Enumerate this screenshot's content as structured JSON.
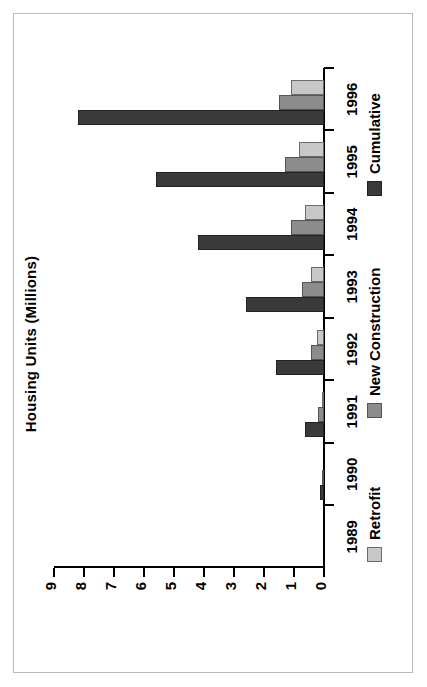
{
  "chart_data": {
    "type": "bar",
    "title": "Housing Units (Millions)",
    "xlabel": "",
    "ylabel": "Housing Units (Millions)",
    "categories": [
      "1989",
      "1990",
      "1991",
      "1992",
      "1993",
      "1994",
      "1995",
      "1996"
    ],
    "ylim": [
      0,
      9
    ],
    "yticks": [
      0,
      1,
      2,
      3,
      4,
      5,
      6,
      7,
      8,
      9
    ],
    "ytick_labels": [
      "0",
      "1",
      "2",
      "3",
      "4",
      "5",
      "6",
      "7",
      "8",
      "9"
    ],
    "grid": false,
    "orientation": "horizontal-rotated",
    "legend_position": "bottom",
    "series": [
      {
        "name": "Retrofit",
        "color": "#c8c8c8",
        "values": [
          0,
          0,
          0.08,
          0.22,
          0.42,
          0.62,
          0.85,
          1.1
        ]
      },
      {
        "name": "New Construction",
        "color": "#8c8c8c",
        "values": [
          0,
          0.04,
          0.2,
          0.42,
          0.75,
          1.1,
          1.3,
          1.5
        ]
      },
      {
        "name": "Cumulative",
        "color": "#3a3a3a",
        "values": [
          0,
          0.12,
          0.65,
          1.6,
          2.6,
          4.2,
          5.6,
          8.2
        ]
      }
    ]
  },
  "frame": {
    "border_color": "#b9b9b9"
  },
  "axis": {
    "tick_color": "#000000",
    "line_color": "#000000"
  }
}
